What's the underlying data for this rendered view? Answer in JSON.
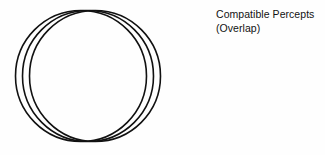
{
  "figure": {
    "background_color": "#fefefe",
    "stroke_color": "#111111",
    "label": {
      "line1": "Compatible Percepts",
      "line2": "(Overlap)"
    },
    "diagram": {
      "type": "three-overlapping-circles",
      "description": "Three equal circles offset horizontally, intersecting at a common top point and a common bottom point",
      "stroke_width": 1.6,
      "circles": [
        {
          "name": "left-circle",
          "cx": 81,
          "cy": 76,
          "r": 65.5
        },
        {
          "name": "middle-circle",
          "cx": 88,
          "cy": 76,
          "r": 65.5
        },
        {
          "name": "right-circle",
          "cx": 95,
          "cy": 76,
          "r": 65.5
        }
      ],
      "intersection_points": [
        {
          "name": "top-intersection",
          "x": 88,
          "y": 11
        },
        {
          "name": "bottom-intersection",
          "x": 88,
          "y": 141
        }
      ]
    }
  }
}
